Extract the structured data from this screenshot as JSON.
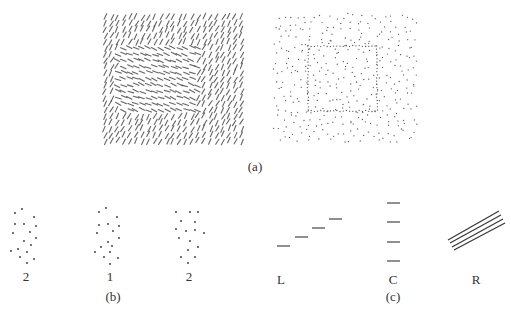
{
  "figure": {
    "panel_a": {
      "label": "(a)",
      "label_pos": [
        255,
        167
      ],
      "texture_left": {
        "description": "oriented line-segment texture, inner square with differently oriented segments",
        "bounds": [
          103,
          15,
          243,
          146
        ],
        "inner_square": [
          117,
          44,
          198,
          112
        ],
        "outer_angle_deg": 62,
        "inner_angle_deg": -22,
        "spacing": 6.2,
        "segment_length": 6,
        "color": "#4a4a4a"
      },
      "texture_right": {
        "description": "random dot texture with inner square region defined by denser aligned dots",
        "bounds": [
          275,
          15,
          414,
          145
        ],
        "inner_square": [
          308,
          46,
          377,
          111
        ],
        "spacing": 7.2,
        "dot_radius": 0.65,
        "color": "#555555"
      }
    },
    "panel_b": {
      "label": "(b)",
      "label_pos": [
        113,
        297
      ],
      "clusters": [
        {
          "label": "2",
          "label_pos": [
            26,
            277
          ],
          "points": [
            [
              15,
              213
            ],
            [
              22,
              209
            ],
            [
              34,
              217
            ],
            [
              15,
              224
            ],
            [
              24,
              224
            ],
            [
              36,
              226
            ],
            [
              13,
              233
            ],
            [
              30,
              232
            ],
            [
              36,
              238
            ],
            [
              24,
              241
            ],
            [
              31,
              245
            ],
            [
              11,
              251
            ],
            [
              18,
              249
            ],
            [
              27,
              252
            ],
            [
              20,
              257
            ],
            [
              34,
              259
            ],
            [
              27,
              263
            ]
          ]
        },
        {
          "label": "1",
          "label_pos": [
            110,
            277
          ],
          "points": [
            [
              99,
              212
            ],
            [
              106,
              208
            ],
            [
              117,
              217
            ],
            [
              99,
              225
            ],
            [
              108,
              224
            ],
            [
              119,
              226
            ],
            [
              97,
              233
            ],
            [
              113,
              231
            ],
            [
              119,
              238
            ],
            [
              108,
              242
            ],
            [
              101,
              247
            ],
            [
              112,
              246
            ],
            [
              95,
              252
            ],
            [
              110,
              252
            ],
            [
              104,
              257
            ],
            [
              118,
              258
            ],
            [
              110,
              264
            ]
          ]
        },
        {
          "label": "2",
          "label_pos": [
            189,
            277
          ],
          "points": [
            [
              176,
              212
            ],
            [
              190,
              212
            ],
            [
              198,
              212
            ],
            [
              181,
              221
            ],
            [
              195,
              222
            ],
            [
              176,
              229
            ],
            [
              186,
              231
            ],
            [
              195,
              230
            ],
            [
              204,
              233
            ],
            [
              179,
              238
            ],
            [
              190,
              241
            ],
            [
              198,
              247
            ],
            [
              188,
              250
            ],
            [
              181,
              257
            ],
            [
              195,
              257
            ],
            [
              188,
              263
            ]
          ]
        }
      ]
    },
    "panel_c": {
      "label": "(c)",
      "label_pos": [
        393,
        297
      ],
      "figures": [
        {
          "label": "L",
          "label_pos": [
            281,
            280
          ],
          "segments": [
            [
              277,
              246,
              290,
              246
            ],
            [
              295,
              237,
              308,
              237
            ],
            [
              312,
              228,
              325,
              228
            ],
            [
              329,
              219,
              342,
              219
            ]
          ]
        },
        {
          "label": "C",
          "label_pos": [
            393,
            280
          ],
          "segments": [
            [
              387,
              203,
              400,
              203
            ],
            [
              387,
              222,
              400,
              222
            ],
            [
              387,
              242,
              400,
              242
            ],
            [
              387,
              261,
              400,
              261
            ]
          ]
        },
        {
          "label": "R",
          "label_pos": [
            476,
            280
          ],
          "segments": [
            [
              448,
              240,
              499,
              211
            ],
            [
              450,
              243,
              501,
              215
            ],
            [
              452,
              247,
              503,
              219
            ],
            [
              454,
              250,
              505,
              223
            ]
          ]
        }
      ],
      "stroke_color": "#333333"
    }
  }
}
